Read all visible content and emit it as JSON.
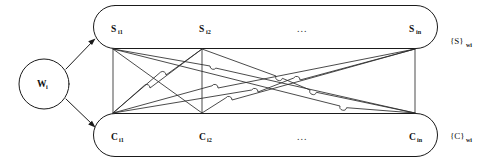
{
  "figure": {
    "type": "diagram",
    "background_color": "#ffffff",
    "line_color": "#1a1a1a"
  },
  "source_node": {
    "name": "word-node",
    "shape": "circle",
    "label_base": "W",
    "label_sub": "i",
    "cx": 44,
    "cy": 84,
    "r": 25
  },
  "arrows": [
    {
      "name": "arrow-to-sense-set",
      "from": [
        66,
        68
      ],
      "to": [
        96,
        38
      ],
      "direction": "up-right"
    },
    {
      "name": "arrow-to-concept-set",
      "from": [
        66,
        100
      ],
      "to": [
        96,
        128
      ],
      "direction": "down-right"
    }
  ],
  "groups": [
    {
      "name": "sense-set",
      "container_shape": "rounded-rectangle",
      "x": 93,
      "y": 5,
      "width": 345,
      "height": 44,
      "side_label": {
        "base": "{S}",
        "sub": "w",
        "sub2": "i",
        "text": "{S}wi"
      },
      "nodes": [
        {
          "name": "node-s-i1",
          "base": "S",
          "sub": "i1",
          "x": 118,
          "y": 29
        },
        {
          "name": "node-s-i2",
          "base": "S",
          "sub": "i2",
          "x": 206,
          "y": 29
        },
        {
          "name": "node-s-in",
          "base": "S",
          "sub": "in",
          "x": 419,
          "y": 29
        }
      ],
      "ellipsis": {
        "name": "sense-ellipsis",
        "text": "...",
        "x": 305,
        "y": 29
      }
    },
    {
      "name": "concept-set",
      "container_shape": "rounded-rectangle",
      "x": 93,
      "y": 113,
      "width": 345,
      "height": 44,
      "side_label": {
        "base": "{C}",
        "sub": "w",
        "sub2": "i",
        "text": "{C}wi"
      },
      "nodes": [
        {
          "name": "node-c-i1",
          "base": "C",
          "sub": "i1",
          "x": 118,
          "y": 137
        },
        {
          "name": "node-c-i2",
          "base": "C",
          "sub": "i2",
          "x": 206,
          "y": 137
        },
        {
          "name": "node-c-in",
          "base": "C",
          "sub": "in",
          "x": 419,
          "y": 137
        }
      ],
      "ellipsis": {
        "name": "concept-ellipsis",
        "text": "...",
        "x": 305,
        "y": 137
      }
    }
  ],
  "connection_ports": {
    "top_y": 49,
    "bottom_y": 113,
    "columns": [
      113,
      202,
      415
    ]
  },
  "edges": [
    {
      "name": "edge-s1-c1",
      "from_col": 0,
      "to_col": 0
    },
    {
      "name": "edge-s1-c2",
      "from_col": 0,
      "to_col": 1
    },
    {
      "name": "edge-s1-cn",
      "from_col": 0,
      "to_col": 2
    },
    {
      "name": "edge-s2-c1",
      "from_col": 1,
      "to_col": 0
    },
    {
      "name": "edge-s2-c2",
      "from_col": 1,
      "to_col": 1
    },
    {
      "name": "edge-s2-cn",
      "from_col": 1,
      "to_col": 2
    },
    {
      "name": "edge-sn-c1",
      "from_col": 2,
      "to_col": 0
    },
    {
      "name": "edge-sn-c2",
      "from_col": 2,
      "to_col": 1
    },
    {
      "name": "edge-sn-cn",
      "from_col": 2,
      "to_col": 2
    }
  ],
  "side_labels": {
    "sense": {
      "text": "{S}",
      "sub": "wi",
      "x": 452,
      "y": 44
    },
    "concept": {
      "text": "{C}",
      "sub": "wi",
      "x": 452,
      "y": 137
    }
  }
}
